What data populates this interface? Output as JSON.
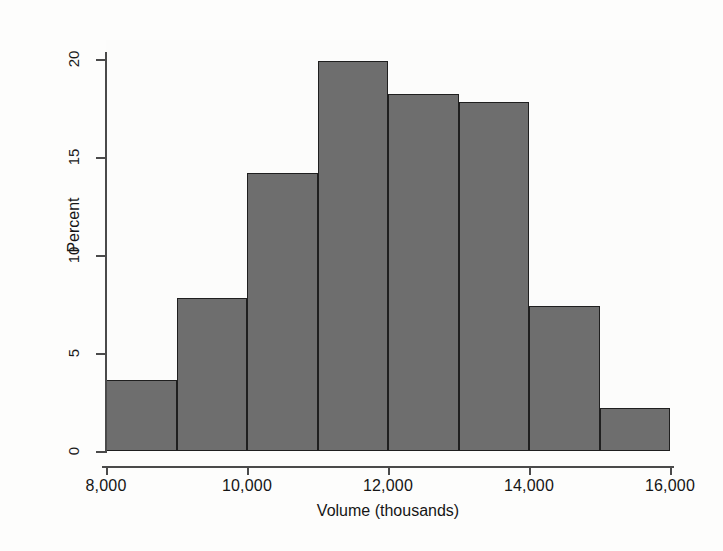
{
  "chart_data": {
    "type": "bar",
    "chart_subtype": "histogram",
    "title": "",
    "subtitle": "",
    "xlabel": "Volume (thousands)",
    "ylabel": "Percent",
    "xlim": [
      8000,
      16000
    ],
    "ylim": [
      0,
      20
    ],
    "grid": false,
    "legend": null,
    "legend_position": "none",
    "bin_width": 1000,
    "xticks": [
      8000,
      10000,
      12000,
      14000,
      16000
    ],
    "xticklabels": [
      "8,000",
      "10,000",
      "12,000",
      "14,000",
      "16,000"
    ],
    "yticks": [
      0,
      5,
      10,
      15,
      20
    ],
    "yticklabels": [
      "0",
      "5",
      "10",
      "15",
      "20"
    ],
    "categories": [
      "8,000-9,000",
      "9,000-10,000",
      "10,000-11,000",
      "11,000-12,000",
      "12,000-13,000",
      "13,000-14,000",
      "14,000-15,000",
      "15,000-16,000"
    ],
    "bin_edges": [
      8000,
      9000,
      10000,
      11000,
      12000,
      13000,
      14000,
      15000,
      16000
    ],
    "values": [
      3.6,
      7.8,
      14.2,
      19.9,
      18.2,
      17.8,
      7.4,
      2.2
    ],
    "bar_color": "#6e6e6e",
    "bar_edge_color": "#1f1f1f",
    "background_color": "#fdfdfc",
    "axis_color": "#4a4a4a",
    "text_color": "#151515"
  },
  "axes": {
    "y_title": "Percent",
    "x_title": "Volume (thousands)"
  }
}
